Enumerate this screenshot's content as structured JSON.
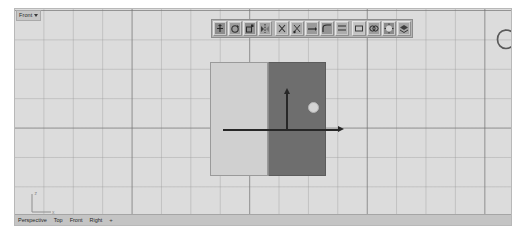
{
  "app": {
    "kind": "3d-modeling-viewport",
    "background_color": "#dcdcdc",
    "grid_minor_color": "#969696",
    "grid_major_color": "#6e6e6e"
  },
  "viewport": {
    "title": "Front",
    "title_caret": "chevron-down-icon",
    "axis_indicator": {
      "vertical_label": "z",
      "horizontal_label": "x"
    }
  },
  "toolbar": {
    "buttons": [
      {
        "name": "move-tool",
        "label": "Move"
      },
      {
        "name": "rotate-tool",
        "label": "Rotate"
      },
      {
        "name": "scale-tool",
        "label": "Scale"
      },
      {
        "name": "mirror-tool",
        "label": "Mirror"
      },
      {
        "name": "trim-tool",
        "label": "Trim"
      },
      {
        "name": "split-tool",
        "label": "Split"
      },
      {
        "name": "extend-tool",
        "label": "Extend"
      },
      {
        "name": "fillet-tool",
        "label": "Fillet"
      },
      {
        "name": "offset-tool",
        "label": "Offset"
      },
      {
        "name": "array-tool",
        "label": "Array"
      },
      {
        "name": "boolean-tool",
        "label": "Boolean"
      },
      {
        "name": "render-tool",
        "label": "Render"
      },
      {
        "name": "layer-tool",
        "label": "Layers"
      }
    ]
  },
  "object": {
    "name": "split-box",
    "left_face_color": "#d0d0d0",
    "right_face_color": "#6e6e6e",
    "gizmo": {
      "vertical_axis": "y-axis-arrow",
      "horizontal_axis": "x-axis-arrow",
      "handle": "plane-handle",
      "arrow_color": "#272727",
      "handle_color": "#d4d4d4"
    }
  },
  "annotation": {
    "shape": "circle-annotation",
    "color": "#5a5a5a"
  },
  "tabs": [
    {
      "label": "Perspective",
      "active": false
    },
    {
      "label": "Top",
      "active": false
    },
    {
      "label": "Front",
      "active": true
    },
    {
      "label": "Right",
      "active": false
    },
    {
      "label": "+",
      "active": false
    }
  ]
}
